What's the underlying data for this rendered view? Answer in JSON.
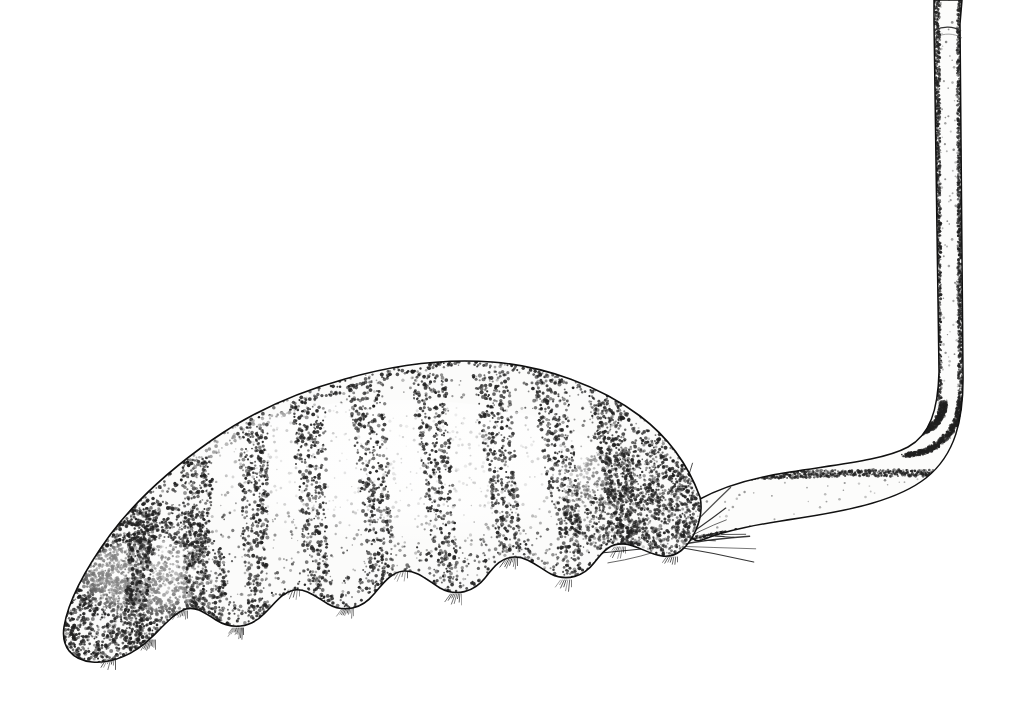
{
  "figure": {
    "kind": "scientific-line-illustration",
    "technique": "pen-and-ink stipple",
    "subject_common_name": "rat-tailed maggot larva",
    "orientation": "lateral view, head to the left, respiratory siphon to the upper right",
    "background_color": "#ffffff",
    "ink_color": "#1a1a1a",
    "stipple_color": "#202020",
    "fill_color": "#fbfbfa",
    "canvas": {
      "width": 1020,
      "height": 717
    }
  },
  "parts": [
    {
      "id": "body",
      "label": "segmented abdomen",
      "description": "Plump curved grub-like body, crescent shaped, thickest near the middle, tapering posteriorly into the siphon",
      "bbox": [
        60,
        358,
        760,
        665
      ],
      "segment_count": 9
    },
    {
      "id": "head",
      "label": "anterior end / head region",
      "description": "Rounded blunt anterior tip at lower left, heavily stippled",
      "bbox": [
        60,
        490,
        230,
        665
      ]
    },
    {
      "id": "ventral-lobes",
      "label": "ventral creeping welts / prolegs",
      "description": "Scalloped rounded lobes along the lower margin, each edged with fine bristles",
      "count": 7
    },
    {
      "id": "setae-fan",
      "label": "caudal setae fan",
      "description": "Spray of fine radiating hairs below the posterior taper where the siphon begins",
      "origin": [
        672,
        546
      ],
      "hair_count": 22
    },
    {
      "id": "siphon-horizontal",
      "label": "respiratory siphon, proximal horizontal run",
      "description": "Tapered tube leaving the body posteriorly and running right, narrowing from about 60 px to 30 px"
    },
    {
      "id": "siphon-bend",
      "label": "respiratory siphon, elbow bend",
      "description": "Smooth right-angle bend at the far right turning the tube upward",
      "bbox": [
        880,
        380,
        975,
        520
      ]
    },
    {
      "id": "siphon-vertical",
      "label": "respiratory siphon, distal vertical run",
      "description": "Slender vertical tube running up and exiting the top edge of the frame",
      "bbox": [
        928,
        0,
        965,
        420
      ]
    },
    {
      "id": "siphon-joint",
      "label": "siphon telescoping joint",
      "description": "Faint transverse collar ring near the top of the vertical tube",
      "y": 30
    }
  ],
  "annotations": {
    "scale_bar": null,
    "figure_number": null,
    "caption": null,
    "labels": []
  }
}
